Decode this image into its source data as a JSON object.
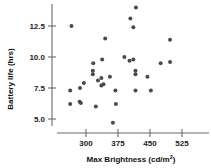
{
  "chart_data": {
    "type": "scatter",
    "title": "",
    "xlabel": "Max Brightness (cd/m2)",
    "xlabel_base": "Max Brightness (cd/m",
    "xlabel_sup": "2",
    "xlabel_tail": ")",
    "ylabel": "Battery life (hrs)",
    "xticks": [
      300,
      375,
      450,
      525
    ],
    "xtick_labels": [
      "300",
      "375",
      "450",
      "525"
    ],
    "yticks": [
      5.0,
      7.5,
      10.0,
      12.5
    ],
    "ytick_labels": [
      "5.0",
      "7.5",
      "10.0",
      "12.5"
    ],
    "xlim": [
      255,
      580
    ],
    "ylim": [
      4.0,
      14.6
    ],
    "grid": false,
    "legend": null,
    "point_color": "#4a4a4a",
    "axis_color": "#6b6b6b",
    "point_radius": 2.0,
    "points": [
      {
        "x": 266,
        "y": 12.5
      },
      {
        "x": 345,
        "y": 11.5
      },
      {
        "x": 497,
        "y": 11.4
      },
      {
        "x": 417,
        "y": 14.0
      },
      {
        "x": 404,
        "y": 13.1
      },
      {
        "x": 411,
        "y": 12.4
      },
      {
        "x": 390,
        "y": 10.0
      },
      {
        "x": 411,
        "y": 9.8
      },
      {
        "x": 402,
        "y": 9.7
      },
      {
        "x": 338,
        "y": 9.8
      },
      {
        "x": 317,
        "y": 9.5
      },
      {
        "x": 475,
        "y": 9.5
      },
      {
        "x": 497,
        "y": 9.6
      },
      {
        "x": 416,
        "y": 8.9
      },
      {
        "x": 416,
        "y": 8.6
      },
      {
        "x": 444,
        "y": 8.4
      },
      {
        "x": 356,
        "y": 8.4
      },
      {
        "x": 316,
        "y": 8.6
      },
      {
        "x": 316,
        "y": 8.9
      },
      {
        "x": 336,
        "y": 8.3
      },
      {
        "x": 328,
        "y": 8.1
      },
      {
        "x": 295,
        "y": 7.9
      },
      {
        "x": 341,
        "y": 7.8
      },
      {
        "x": 336,
        "y": 7.7
      },
      {
        "x": 286,
        "y": 7.5
      },
      {
        "x": 263,
        "y": 7.3
      },
      {
        "x": 369,
        "y": 7.3
      },
      {
        "x": 416,
        "y": 7.3
      },
      {
        "x": 452,
        "y": 7.3
      },
      {
        "x": 285,
        "y": 6.4
      },
      {
        "x": 288,
        "y": 6.3
      },
      {
        "x": 263,
        "y": 6.2
      },
      {
        "x": 323,
        "y": 6.0
      },
      {
        "x": 370,
        "y": 6.2
      },
      {
        "x": 363,
        "y": 4.7
      }
    ]
  }
}
